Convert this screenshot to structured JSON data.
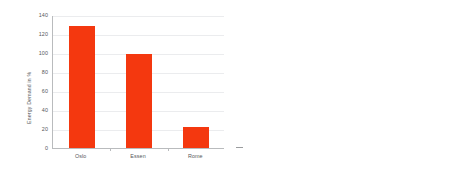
{
  "figure": {
    "background": "#ffffff",
    "accent_red": "#f4380f",
    "panel_gray": "#e2e2e2"
  },
  "chart_data": [
    {
      "type": "bar",
      "title": "",
      "xlabel": "",
      "ylabel": "Energy Demand in %",
      "categories": [
        "Oslo",
        "Essen",
        "Rome"
      ],
      "values": [
        128,
        99,
        22
      ],
      "ylim": [
        0,
        140
      ],
      "yticks": [
        0,
        20,
        40,
        60,
        80,
        100,
        120,
        140
      ],
      "ytick_labels": [
        "0",
        "20",
        "40",
        "60",
        "80",
        "100",
        "120",
        "140"
      ],
      "grid": "horizontal",
      "legend": "none",
      "bar_color": "#f4380f",
      "plot_background": "#ffffff"
    },
    {
      "type": "area",
      "title": "",
      "xlabel": "",
      "ylabel": "Energy Demand in kWh/m²a",
      "x": [
        1965,
        1967,
        1969,
        1971,
        1973,
        1975,
        1977,
        1979,
        1981,
        1983,
        1985,
        1987,
        1989,
        1991,
        1993,
        1995,
        1997,
        1999
      ],
      "values": [
        740,
        745,
        742,
        730,
        705,
        660,
        600,
        520,
        440,
        370,
        320,
        295,
        270,
        240,
        205,
        175,
        140,
        95
      ],
      "ylim": [
        0,
        1200
      ],
      "xlim": [
        1964,
        1999
      ],
      "yticks": [
        0,
        200,
        400,
        600,
        800,
        1000,
        1200
      ],
      "ytick_labels": [
        "0",
        "200",
        "400",
        "600",
        "800",
        "1000",
        "1200"
      ],
      "xticks": [
        1965,
        1970,
        1975,
        1980,
        1985,
        1990,
        1995
      ],
      "xtick_labels": [
        "1965",
        "1970",
        "1975",
        "1980",
        "1985",
        "1990",
        "1995"
      ],
      "grid": "both",
      "legend": "none",
      "area_color": "#f4380f",
      "plot_background": "#e2e2e2",
      "gridline_color": "#fbfbfb"
    }
  ]
}
